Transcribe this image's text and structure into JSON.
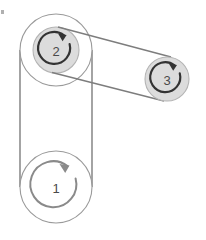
{
  "diagram": {
    "background_color": "#ffffff",
    "canvas": {
      "width": 206,
      "height": 240
    },
    "colors": {
      "outline": "#9a9a9a",
      "belt": "#7d7d7d",
      "hub_fill": "#dcdcdc",
      "hub_stroke": "#b4b4b4",
      "arrow": "#333333",
      "arrow_light": "#8a8a8a",
      "label_text": "#4a4a4a",
      "artifact": "#b0b0b0"
    },
    "pulleys": [
      {
        "id": "pulley-1",
        "label": "1",
        "cx": 56,
        "cy": 187,
        "outer_radius": 36,
        "hub_radius": 0,
        "arc_radius": 23,
        "filled_hub": false,
        "rotation": "clockwise",
        "arrow_color": "#8a8a8a",
        "arc_gap_degrees": 55,
        "arc_start_degrees": -60
      },
      {
        "id": "pulley-2",
        "label": "2",
        "cx": 56,
        "cy": 50,
        "outer_radius": 36,
        "hub_radius": 23,
        "arc_radius": 16,
        "filled_hub": true,
        "rotation": "clockwise",
        "arrow_color": "#333333",
        "arc_gap_degrees": 55,
        "arc_start_degrees": -60
      },
      {
        "id": "pulley-3",
        "label": "3",
        "cx": 167,
        "cy": 79,
        "outer_radius": 0,
        "hub_radius": 22,
        "arc_radius": 15,
        "filled_hub": true,
        "rotation": "clockwise",
        "arrow_color": "#333333",
        "arc_gap_degrees": 55,
        "arc_start_degrees": -60
      }
    ],
    "belts": [
      {
        "id": "belt-lower",
        "name": "belt-pulley1-pulley2",
        "from": "pulley-1",
        "to": "pulley-2",
        "segments": [
          {
            "x1": 20,
            "y1": 50,
            "x2": 20,
            "y2": 187
          },
          {
            "x1": 92,
            "y1": 50,
            "x2": 92,
            "y2": 187
          }
        ]
      },
      {
        "id": "belt-upper",
        "name": "belt-pulley2-pulley3",
        "from": "pulley-2",
        "to": "pulley-3",
        "segments": [
          {
            "x1": 60,
            "y1": 27,
            "x2": 171,
            "y2": 57
          },
          {
            "x1": 52,
            "y1": 73,
            "x2": 163,
            "y2": 101
          }
        ]
      }
    ],
    "artifact_mark": {
      "name": "speck-artifact",
      "x": 1,
      "y": 10,
      "width": 3,
      "height": 4
    }
  }
}
